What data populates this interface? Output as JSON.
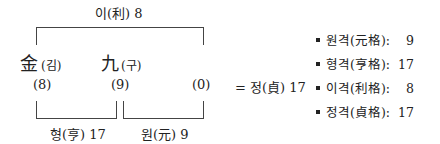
{
  "top_label": "이(利) 8",
  "characters": [
    {
      "hanja": "金",
      "reading": "(김)",
      "stroke": "(8)"
    },
    {
      "hanja": "九",
      "reading": "(구)",
      "stroke": "(9)"
    },
    {
      "hanja": "",
      "reading": "",
      "stroke": "(0)"
    }
  ],
  "bottom_labels": {
    "left": "형(亨) 17",
    "right": "원(元) 9"
  },
  "equals_label": "= 정(貞) 17",
  "summary": [
    {
      "label": "원격(元格):",
      "value": "9"
    },
    {
      "label": "형격(亨格):",
      "value": "17"
    },
    {
      "label": "이격(利格):",
      "value": "8"
    },
    {
      "label": "정격(貞格):",
      "value": "17"
    }
  ]
}
